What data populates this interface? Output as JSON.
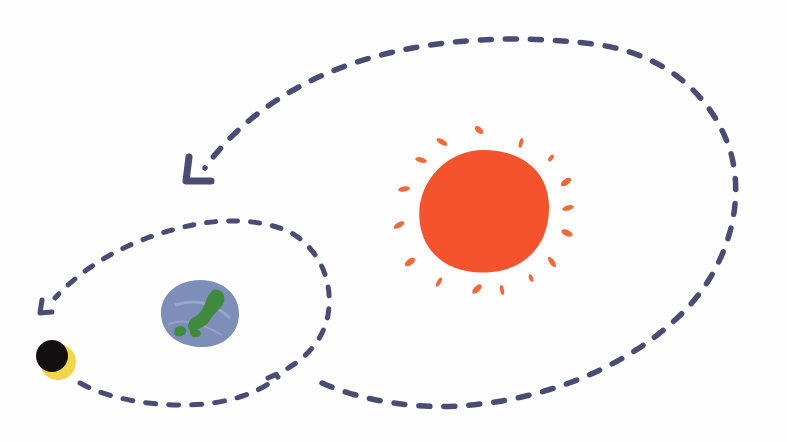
{
  "illustration": {
    "subject": "Sun, Earth and Moon with dashed orbital paths",
    "colors": {
      "background": "#fefefe",
      "sun": "#f4532e",
      "sun_rays": "#f26a3a",
      "earth_ocean": "#7d8fb8",
      "earth_land": "#3f8a3c",
      "moon_dark": "#141010",
      "moon_lit": "#f2d64a",
      "orbit_path": "#4a4d73"
    },
    "elements": [
      {
        "name": "sun",
        "icon": "sun-icon"
      },
      {
        "name": "earth",
        "icon": "earth-icon"
      },
      {
        "name": "moon",
        "icon": "moon-crescent-icon"
      },
      {
        "name": "earth-orbit-path",
        "icon": "dashed-arrow-icon"
      },
      {
        "name": "moon-orbit-path",
        "icon": "dashed-arrow-icon"
      }
    ]
  }
}
